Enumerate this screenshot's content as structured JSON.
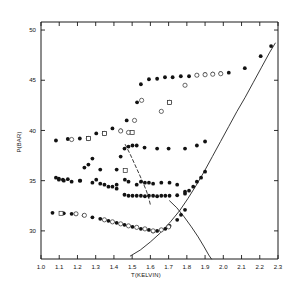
{
  "figure": {
    "title": "",
    "background_color": "#ffffff",
    "ink_color": "#141414"
  },
  "axes": {
    "x_title": "T(KELVIN)",
    "y_title": "P(BAR)",
    "x_ticklabels": [
      "1.0",
      "1.1",
      "1.2",
      "1.3",
      "1.4",
      "1.5",
      "1.6",
      "1.7",
      "1.8",
      "1.9",
      "2.0",
      "2.1",
      "2.2",
      "2.3"
    ],
    "y_ticklabels": [
      "30",
      "35",
      "40",
      "45",
      "50"
    ]
  },
  "chart_data": {
    "type": "scatter",
    "title": "",
    "xlabel": "T(KELVIN)",
    "ylabel": "P(BAR)",
    "xlim": [
      1.0,
      2.3
    ],
    "ylim": [
      27.2,
      50.8
    ],
    "xticks": [
      1.0,
      1.1,
      1.2,
      1.3,
      1.4,
      1.5,
      1.6,
      1.7,
      1.8,
      1.9,
      2.0,
      2.1,
      2.2,
      2.3
    ],
    "yticks": [
      30,
      35,
      40,
      45,
      50
    ],
    "grid": false,
    "legend": "none",
    "series": [
      {
        "name": "upper-branch-filled",
        "marker": "filled-circle",
        "points": [
          [
            1.082,
            39.0
          ],
          [
            1.147,
            39.15
          ],
          [
            1.213,
            39.2
          ],
          [
            1.257,
            39.25
          ],
          [
            1.303,
            39.7
          ],
          [
            1.348,
            39.75
          ],
          [
            1.392,
            40.2
          ],
          [
            1.437,
            40.0
          ],
          [
            1.47,
            41.0
          ],
          [
            1.5,
            39.8
          ],
          [
            1.527,
            42.8
          ],
          [
            1.548,
            44.6
          ],
          [
            1.592,
            45.1
          ],
          [
            1.637,
            45.15
          ],
          [
            1.68,
            45.3
          ],
          [
            1.722,
            45.3
          ],
          [
            1.767,
            45.4
          ],
          [
            1.812,
            45.4
          ],
          [
            1.855,
            45.5
          ],
          [
            1.9,
            45.6
          ],
          [
            1.942,
            45.65
          ],
          [
            1.985,
            45.7
          ],
          [
            2.03,
            45.75
          ],
          [
            2.118,
            46.2
          ],
          [
            2.205,
            47.4
          ],
          [
            2.262,
            48.4
          ]
        ]
      },
      {
        "name": "upper-branch-open",
        "marker": "open-circle",
        "points": [
          [
            1.168,
            39.1
          ],
          [
            1.26,
            39.2
          ],
          [
            1.348,
            39.7
          ],
          [
            1.437,
            39.95
          ],
          [
            1.48,
            39.8
          ],
          [
            1.513,
            41.0
          ],
          [
            1.552,
            43.0
          ],
          [
            1.66,
            41.9
          ],
          [
            1.705,
            42.8
          ],
          [
            1.79,
            44.5
          ],
          [
            1.855,
            45.5
          ],
          [
            1.9,
            45.55
          ],
          [
            1.942,
            45.6
          ],
          [
            1.986,
            45.65
          ]
        ]
      },
      {
        "name": "mid-branch-upper",
        "marker": "filled-circle",
        "points": [
          [
            1.082,
            35.3
          ],
          [
            1.098,
            35.2
          ],
          [
            1.12,
            35.1
          ],
          [
            1.147,
            35.15
          ],
          [
            1.213,
            35.0
          ],
          [
            1.238,
            36.3
          ],
          [
            1.26,
            36.6
          ],
          [
            1.282,
            37.2
          ],
          [
            1.303,
            35.1
          ],
          [
            1.325,
            36.1
          ],
          [
            1.348,
            34.6
          ],
          [
            1.392,
            34.4
          ],
          [
            1.415,
            36.1
          ],
          [
            1.437,
            37.4
          ],
          [
            1.458,
            38.2
          ],
          [
            1.48,
            38.4
          ],
          [
            1.502,
            38.5
          ],
          [
            1.525,
            38.5
          ],
          [
            1.568,
            38.3
          ],
          [
            1.637,
            38.2
          ],
          [
            1.7,
            38.2
          ],
          [
            1.79,
            38.2
          ],
          [
            1.855,
            38.5
          ],
          [
            1.9,
            38.9
          ]
        ]
      },
      {
        "name": "mid-branch-lower",
        "marker": "filled-circle",
        "points": [
          [
            1.098,
            35.1
          ],
          [
            1.125,
            35.0
          ],
          [
            1.168,
            34.9
          ],
          [
            1.215,
            35.0
          ],
          [
            1.282,
            34.8
          ],
          [
            1.325,
            34.7
          ],
          [
            1.37,
            34.4
          ],
          [
            1.415,
            34.6
          ],
          [
            1.46,
            35.1
          ],
          [
            1.48,
            34.9
          ],
          [
            1.525,
            34.6
          ],
          [
            1.548,
            34.9
          ],
          [
            1.57,
            34.8
          ],
          [
            1.592,
            34.8
          ],
          [
            1.615,
            34.7
          ],
          [
            1.66,
            34.8
          ],
          [
            1.705,
            34.8
          ],
          [
            1.747,
            34.6
          ],
          [
            1.79,
            33.9
          ]
        ]
      },
      {
        "name": "plateau-branch",
        "marker": "filled-circle",
        "points": [
          [
            1.415,
            34.2
          ],
          [
            1.458,
            33.6
          ],
          [
            1.48,
            33.5
          ],
          [
            1.502,
            33.5
          ],
          [
            1.525,
            33.5
          ],
          [
            1.548,
            33.5
          ],
          [
            1.57,
            33.45
          ],
          [
            1.592,
            33.5
          ],
          [
            1.615,
            33.5
          ],
          [
            1.637,
            33.45
          ],
          [
            1.66,
            33.5
          ],
          [
            1.682,
            33.5
          ],
          [
            1.705,
            33.5
          ],
          [
            1.747,
            33.55
          ],
          [
            1.79,
            33.7
          ],
          [
            1.812,
            34.0
          ],
          [
            1.835,
            34.4
          ],
          [
            1.855,
            34.9
          ],
          [
            1.878,
            35.3
          ],
          [
            1.9,
            35.9
          ]
        ]
      },
      {
        "name": "lower-branch-filled",
        "marker": "filled-circle",
        "points": [
          [
            1.063,
            31.8
          ],
          [
            1.125,
            31.75
          ],
          [
            1.168,
            31.7
          ],
          [
            1.192,
            31.7
          ],
          [
            1.235,
            31.55
          ],
          [
            1.282,
            31.35
          ],
          [
            1.325,
            31.2
          ],
          [
            1.37,
            31.0
          ],
          [
            1.415,
            30.8
          ],
          [
            1.458,
            30.6
          ],
          [
            1.502,
            30.4
          ],
          [
            1.548,
            30.2
          ],
          [
            1.592,
            30.1
          ],
          [
            1.615,
            29.95
          ],
          [
            1.637,
            30.0
          ],
          [
            1.682,
            30.2
          ],
          [
            1.705,
            30.5
          ],
          [
            1.747,
            31.1
          ],
          [
            1.768,
            31.6
          ],
          [
            1.79,
            32.1
          ]
        ]
      },
      {
        "name": "lower-branch-open",
        "marker": "open-circle",
        "points": [
          [
            1.192,
            31.7
          ],
          [
            1.238,
            31.55
          ],
          [
            1.348,
            31.1
          ],
          [
            1.392,
            30.9
          ],
          [
            1.437,
            30.7
          ],
          [
            1.48,
            30.5
          ],
          [
            1.525,
            30.35
          ],
          [
            1.57,
            30.2
          ],
          [
            1.615,
            30.0
          ],
          [
            1.66,
            30.1
          ],
          [
            1.7,
            30.4
          ]
        ]
      },
      {
        "name": "scattered-squares",
        "marker": "open-square",
        "points": [
          [
            1.11,
            31.75
          ],
          [
            1.462,
            36.0
          ],
          [
            1.5,
            39.8
          ],
          [
            1.705,
            42.8
          ],
          [
            1.348,
            39.7
          ],
          [
            1.26,
            39.2
          ]
        ]
      }
    ],
    "curves": [
      {
        "name": "melting-curve-rising",
        "style": "solid",
        "points": [
          [
            1.49,
            27.5
          ],
          [
            1.545,
            28.1
          ],
          [
            1.6,
            28.9
          ],
          [
            1.655,
            29.8
          ],
          [
            1.71,
            30.9
          ],
          [
            1.76,
            32.0
          ],
          [
            1.805,
            33.2
          ],
          [
            1.85,
            34.5
          ],
          [
            1.895,
            35.9
          ],
          [
            1.94,
            37.4
          ],
          [
            1.985,
            38.9
          ],
          [
            2.03,
            40.4
          ],
          [
            2.075,
            41.9
          ],
          [
            2.12,
            43.3
          ],
          [
            2.165,
            44.8
          ],
          [
            2.21,
            46.3
          ],
          [
            2.255,
            47.8
          ],
          [
            2.285,
            48.7
          ]
        ]
      },
      {
        "name": "lambda-line-descending",
        "style": "solid",
        "points": [
          [
            1.705,
            33.0
          ],
          [
            1.745,
            32.3
          ],
          [
            1.785,
            31.4
          ],
          [
            1.825,
            30.4
          ],
          [
            1.862,
            29.4
          ],
          [
            1.895,
            28.4
          ],
          [
            1.92,
            27.6
          ],
          [
            1.935,
            27.2
          ]
        ]
      },
      {
        "name": "dashed-transition-line",
        "style": "dashed",
        "points": [
          [
            1.462,
            38.6
          ],
          [
            1.49,
            37.6
          ],
          [
            1.515,
            36.6
          ],
          [
            1.54,
            35.6
          ],
          [
            1.562,
            34.7
          ],
          [
            1.578,
            34.0
          ],
          [
            1.592,
            33.2
          ],
          [
            1.6,
            32.6
          ]
        ]
      }
    ]
  }
}
